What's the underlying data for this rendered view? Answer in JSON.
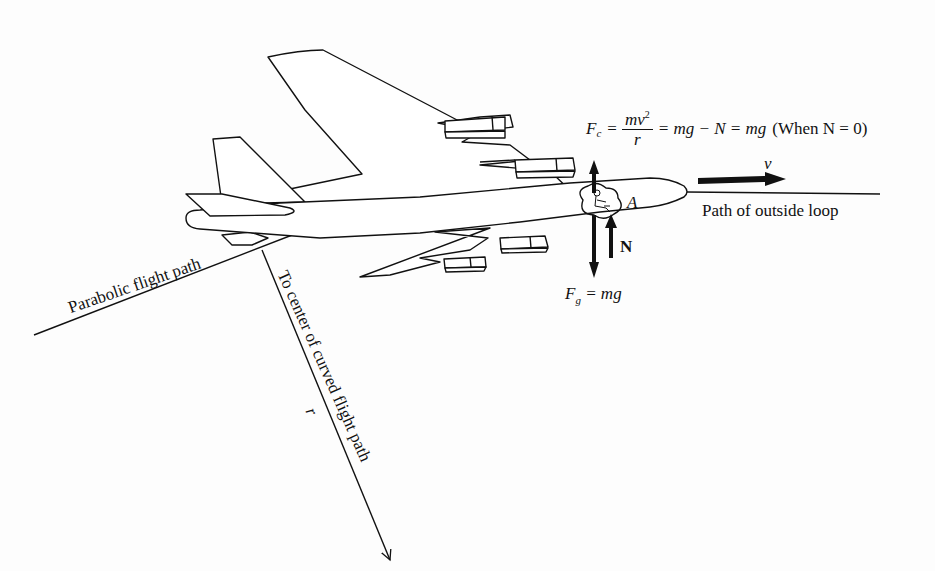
{
  "figure": {
    "type": "physics free-body diagram",
    "colors": {
      "line": "#111111",
      "background": "#fdfdfd"
    }
  },
  "equation": {
    "lhs_symbol": "F",
    "lhs_subscript": "c",
    "equals1": "=",
    "frac_numerator": "mv",
    "frac_numerator_exp": "2",
    "frac_denominator": "r",
    "rest": "= mg − N = mg",
    "condition": "(When N = 0)"
  },
  "labels": {
    "velocity": "v",
    "point": "A",
    "normal_force": "N",
    "gravity_symbol": "F",
    "gravity_subscript": "g",
    "gravity_rhs": "= mg",
    "outside_loop_path": "Path of outside loop",
    "parabolic_path": "Parabolic flight path",
    "to_center": "To center of curved flight path",
    "radius": "r"
  },
  "arrows": [
    {
      "name": "centripetal-force",
      "direction": "up",
      "label": "Fc"
    },
    {
      "name": "gravity-force",
      "direction": "down",
      "label": "Fg = mg"
    },
    {
      "name": "normal-force",
      "direction": "up",
      "label": "N"
    },
    {
      "name": "velocity",
      "direction": "right",
      "label": "v"
    },
    {
      "name": "radius",
      "direction": "down-right",
      "label": "r"
    }
  ]
}
